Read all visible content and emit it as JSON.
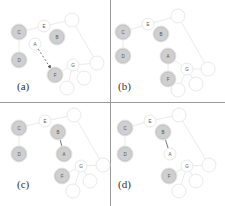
{
  "figure": {
    "panels": [
      {
        "id": "a",
        "label": "(a)",
        "nodes": [
          {
            "key": "c",
            "label": "C",
            "x": 19,
            "y": 32,
            "r": 7,
            "filled": true
          },
          {
            "key": "d",
            "label": "D",
            "x": 19,
            "y": 60,
            "r": 7,
            "filled": true
          },
          {
            "key": "e",
            "label": "E",
            "x": 44,
            "y": 26,
            "r": 6,
            "filled": false
          },
          {
            "key": "b",
            "label": "B",
            "x": 57,
            "y": 37,
            "r": 7,
            "filled": true
          },
          {
            "key": "a",
            "label": "A",
            "x": 35,
            "y": 44,
            "r": 6,
            "filled": false
          },
          {
            "key": "f",
            "label": "F",
            "x": 55,
            "y": 75,
            "r": 7,
            "filled": true
          },
          {
            "key": "t1",
            "label": "",
            "x": 72,
            "y": 20,
            "r": 7,
            "filled": false
          },
          {
            "key": "t2",
            "label": "",
            "x": 97,
            "y": 63,
            "r": 7,
            "filled": false
          },
          {
            "key": "g",
            "label": "G",
            "x": 73,
            "y": 65,
            "r": 6,
            "filled": false
          },
          {
            "key": "t3",
            "label": "",
            "x": 84,
            "y": 78,
            "r": 7,
            "filled": false
          },
          {
            "key": "t4",
            "label": "",
            "x": 67,
            "y": 88,
            "r": 7,
            "filled": false
          }
        ],
        "edges": [
          [
            "c",
            "e"
          ],
          [
            "e",
            "t1"
          ],
          [
            "t1",
            "t2"
          ],
          [
            "c",
            "d"
          ],
          [
            "a",
            "f"
          ],
          [
            "g",
            "t2"
          ],
          [
            "g",
            "t3"
          ],
          [
            "g",
            "t4"
          ],
          [
            "f",
            "g"
          ]
        ],
        "arrow_edges": [
          [
            "a",
            "f"
          ]
        ]
      },
      {
        "id": "b",
        "label": "(b)",
        "nodes": [
          {
            "key": "c",
            "label": "C",
            "x": 11,
            "y": 32,
            "r": 7,
            "filled": true
          },
          {
            "key": "d",
            "label": "D",
            "x": 11,
            "y": 56,
            "r": 7,
            "filled": true
          },
          {
            "key": "e",
            "label": "E",
            "x": 36,
            "y": 24,
            "r": 6,
            "filled": false
          },
          {
            "key": "b",
            "label": "B",
            "x": 49,
            "y": 34,
            "r": 7,
            "filled": true
          },
          {
            "key": "a",
            "label": "A",
            "x": 56,
            "y": 56,
            "r": 7,
            "filled": true
          },
          {
            "key": "f",
            "label": "F",
            "x": 56,
            "y": 79,
            "r": 7,
            "filled": true
          },
          {
            "key": "t1",
            "label": "",
            "x": 66,
            "y": 16,
            "r": 7,
            "filled": false
          },
          {
            "key": "t2",
            "label": "",
            "x": 96,
            "y": 69,
            "r": 7,
            "filled": false
          },
          {
            "key": "g",
            "label": "G",
            "x": 75,
            "y": 69,
            "r": 6,
            "filled": false
          },
          {
            "key": "t3",
            "label": "",
            "x": 84,
            "y": 84,
            "r": 7,
            "filled": false
          },
          {
            "key": "t4",
            "label": "",
            "x": 66,
            "y": 90,
            "r": 7,
            "filled": false
          }
        ],
        "edges": [
          [
            "c",
            "e"
          ],
          [
            "e",
            "t1"
          ],
          [
            "t1",
            "t2"
          ],
          [
            "c",
            "d"
          ],
          [
            "a",
            "f"
          ],
          [
            "a",
            "g"
          ],
          [
            "g",
            "t2"
          ],
          [
            "g",
            "t3"
          ],
          [
            "g",
            "t4"
          ]
        ],
        "arrow_edges": []
      },
      {
        "id": "c",
        "label": "(c)",
        "nodes": [
          {
            "key": "c",
            "label": "C",
            "x": 19,
            "y": 25,
            "r": 7,
            "filled": true
          },
          {
            "key": "d",
            "label": "D",
            "x": 19,
            "y": 51,
            "r": 7,
            "filled": true
          },
          {
            "key": "e",
            "label": "E",
            "x": 45,
            "y": 18,
            "r": 6,
            "filled": false
          },
          {
            "key": "b",
            "label": "B",
            "x": 58,
            "y": 29,
            "r": 7,
            "filled": true
          },
          {
            "key": "a",
            "label": "A",
            "x": 64,
            "y": 51,
            "r": 7,
            "filled": true
          },
          {
            "key": "f",
            "label": "F",
            "x": 62,
            "y": 73,
            "r": 7,
            "filled": true
          },
          {
            "key": "t1",
            "label": "",
            "x": 74,
            "y": 12,
            "r": 7,
            "filled": false
          },
          {
            "key": "t2",
            "label": "",
            "x": 103,
            "y": 62,
            "r": 7,
            "filled": false
          },
          {
            "key": "g",
            "label": "G",
            "x": 81,
            "y": 63,
            "r": 6,
            "filled": false
          },
          {
            "key": "t3",
            "label": "",
            "x": 90,
            "y": 78,
            "r": 7,
            "filled": false
          },
          {
            "key": "t4",
            "label": "",
            "x": 73,
            "y": 88,
            "r": 7,
            "filled": false
          }
        ],
        "edges": [
          [
            "c",
            "e"
          ],
          [
            "e",
            "t1"
          ],
          [
            "t1",
            "t2"
          ],
          [
            "c",
            "d"
          ],
          [
            "b",
            "a"
          ],
          [
            "g",
            "t2"
          ],
          [
            "g",
            "t3"
          ],
          [
            "g",
            "t4"
          ],
          [
            "f",
            "g"
          ]
        ],
        "arrow_edges": []
      },
      {
        "id": "d",
        "label": "(d)",
        "nodes": [
          {
            "key": "c",
            "label": "C",
            "x": 13,
            "y": 25,
            "r": 7,
            "filled": true
          },
          {
            "key": "d",
            "label": "D",
            "x": 13,
            "y": 51,
            "r": 7,
            "filled": true
          },
          {
            "key": "e",
            "label": "E",
            "x": 38,
            "y": 18,
            "r": 6,
            "filled": false
          },
          {
            "key": "b",
            "label": "B",
            "x": 51,
            "y": 29,
            "r": 7,
            "filled": true
          },
          {
            "key": "a",
            "label": "A",
            "x": 58,
            "y": 51,
            "r": 6,
            "filled": false
          },
          {
            "key": "f",
            "label": "F",
            "x": 57,
            "y": 73,
            "r": 7,
            "filled": true
          },
          {
            "key": "t1",
            "label": "",
            "x": 67,
            "y": 12,
            "r": 7,
            "filled": false
          },
          {
            "key": "t2",
            "label": "",
            "x": 97,
            "y": 62,
            "r": 7,
            "filled": false
          },
          {
            "key": "g",
            "label": "G",
            "x": 75,
            "y": 63,
            "r": 6,
            "filled": false
          },
          {
            "key": "t3",
            "label": "",
            "x": 84,
            "y": 78,
            "r": 7,
            "filled": false
          },
          {
            "key": "t4",
            "label": "",
            "x": 67,
            "y": 88,
            "r": 7,
            "filled": false
          }
        ],
        "edges": [
          [
            "c",
            "e"
          ],
          [
            "e",
            "t1"
          ],
          [
            "t1",
            "t2"
          ],
          [
            "c",
            "d"
          ],
          [
            "b",
            "a"
          ],
          [
            "g",
            "t2"
          ],
          [
            "g",
            "t3"
          ],
          [
            "g",
            "t4"
          ],
          [
            "f",
            "g"
          ]
        ],
        "arrow_edges": []
      }
    ],
    "colors": {
      "filled_node": "#cfcfcf",
      "filled_ring": "#e6e6e6",
      "empty_node": "#ffffff",
      "empty_stroke": "#e2e2e2",
      "edge": "#e4e4e4",
      "dark_edge": "#555555",
      "label_text": "#555555",
      "divider": "#9a9a9a"
    }
  }
}
